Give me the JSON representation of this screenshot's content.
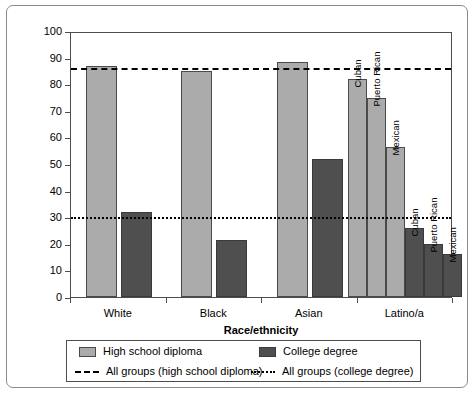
{
  "chart_data": {
    "type": "bar",
    "title": "",
    "xlabel": "Race/ethnicity",
    "ylabel": "Percentage who complete education",
    "ylim": [
      0,
      100
    ],
    "ytick_values": [
      0,
      10,
      20,
      30,
      40,
      50,
      60,
      70,
      80,
      90,
      100
    ],
    "ytick_labels": [
      "0",
      "10",
      "20",
      "30",
      "40",
      "50",
      "60",
      "70",
      "80",
      "90",
      "100"
    ],
    "grid": false,
    "legend_position": "below-axes",
    "categories": [
      "White",
      "Black",
      "Asian",
      "Latino/a"
    ],
    "series": [
      {
        "name": "High school diploma",
        "color": "#ababab",
        "values": [
          87,
          85,
          88.5,
          null
        ]
      },
      {
        "name": "College degree",
        "color": "#4f4f4f",
        "values": [
          32,
          21.5,
          52,
          null
        ]
      }
    ],
    "latino_subgroups": {
      "labels": [
        "Cuban",
        "Puerto Rican",
        "Mexican"
      ],
      "high_school_diploma": [
        82,
        75,
        56.5
      ],
      "college_degree": [
        26,
        20,
        16
      ]
    },
    "reference_lines": [
      {
        "name": "All groups (high school diploma)",
        "value": 87,
        "style": "dashed",
        "color": "#000000"
      },
      {
        "name": "All groups (college degree)",
        "value": 31,
        "style": "dotted",
        "color": "#000000"
      }
    ],
    "legend_entries": [
      {
        "label": "High school diploma",
        "marker": "swatch-light"
      },
      {
        "label": "College degree",
        "marker": "swatch-dark"
      },
      {
        "label": "All groups (high school diploma)",
        "marker": "line-dashed"
      },
      {
        "label": "All groups (college degree)",
        "marker": "line-dotted"
      }
    ]
  }
}
